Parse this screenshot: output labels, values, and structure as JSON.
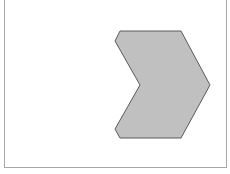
{
  "diagram": {
    "frame": {
      "border_color": "#a8a8a8",
      "background": "#ffffff"
    },
    "shape": {
      "type": "chevron",
      "fill": "#c0c0c0",
      "stroke": "#5a5a5a",
      "points": "120,31 181,31 210,85 181,138 120,138 115,129 140,85 115,41"
    }
  }
}
